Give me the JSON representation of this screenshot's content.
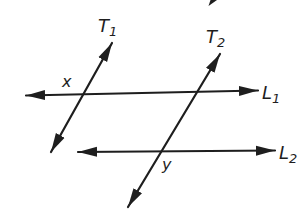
{
  "diagram": {
    "ink": "#1e1e1e",
    "background": "#ffffff",
    "parallel_lines": [
      {
        "name": "L1",
        "label_main": "L",
        "label_sub": "1"
      },
      {
        "name": "L2",
        "label_main": "L",
        "label_sub": "2"
      }
    ],
    "transversals": [
      {
        "name": "T1",
        "label_main": "T",
        "label_sub": "1"
      },
      {
        "name": "T2",
        "label_main": "T",
        "label_sub": "2"
      }
    ],
    "angles": [
      {
        "label": "x"
      },
      {
        "label": "y"
      }
    ]
  }
}
